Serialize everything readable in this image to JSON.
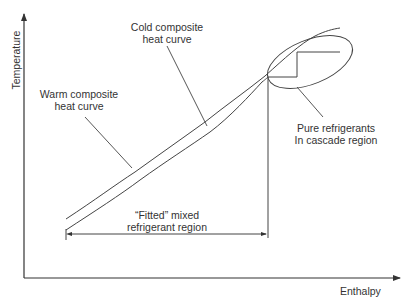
{
  "diagram": {
    "type": "composite heat curves",
    "axes": {
      "y_label": "Temperature",
      "x_label": "Enthalpy"
    },
    "labels": {
      "cold_curve_line1": "Cold composite",
      "cold_curve_line2": "heat curve",
      "warm_curve_line1": "Warm composite",
      "warm_curve_line2": "heat curve",
      "cascade_line1": "Pure refrigerants",
      "cascade_line2": "In cascade region",
      "mixed_line1": "“Fitted” mixed",
      "mixed_line2": "refrigerant region"
    },
    "colors": {
      "line": "#3a3a3a",
      "text": "#333333",
      "background": "#ffffff"
    }
  }
}
